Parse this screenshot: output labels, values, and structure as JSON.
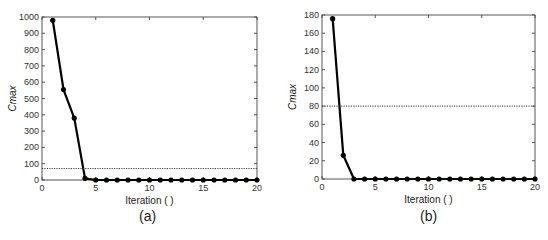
{
  "chart_data": [
    {
      "type": "line",
      "panel_label": "(a)",
      "title": "",
      "xlabel": "Iteration ( )",
      "ylabel": "Cmax",
      "xlim": [
        0,
        20
      ],
      "ylim": [
        0,
        1000
      ],
      "xticks": [
        0,
        5,
        10,
        15,
        20
      ],
      "yticks": [
        0,
        100,
        200,
        300,
        400,
        500,
        600,
        700,
        800,
        900,
        1000
      ],
      "grid": false,
      "legend": null,
      "x": [
        1,
        2,
        3,
        4,
        5,
        6,
        7,
        8,
        9,
        10,
        11,
        12,
        13,
        14,
        15,
        16,
        17,
        18,
        19,
        20
      ],
      "series": [
        {
          "name": "Cmax",
          "style": "solid-black-markers",
          "values": [
            980,
            555,
            380,
            10,
            0,
            0,
            0,
            0,
            0,
            0,
            0,
            0,
            0,
            0,
            0,
            0,
            0,
            0,
            0,
            0
          ]
        },
        {
          "name": "threshold",
          "style": "dotted",
          "constant": 70
        }
      ]
    },
    {
      "type": "line",
      "panel_label": "(b)",
      "title": "",
      "xlabel": "Iteration ( )",
      "ylabel": "Cmax",
      "xlim": [
        0,
        20
      ],
      "ylim": [
        0,
        180
      ],
      "xticks": [
        0,
        5,
        10,
        15,
        20
      ],
      "yticks": [
        0,
        20,
        40,
        60,
        80,
        100,
        120,
        140,
        160,
        180
      ],
      "grid": false,
      "legend": null,
      "x": [
        1,
        2,
        3,
        4,
        5,
        6,
        7,
        8,
        9,
        10,
        11,
        12,
        13,
        14,
        15,
        16,
        17,
        18,
        19,
        20
      ],
      "series": [
        {
          "name": "Cmax",
          "style": "solid-black-markers",
          "values": [
            176,
            26,
            0,
            0,
            0,
            0,
            0,
            0,
            0,
            0,
            0,
            0,
            0,
            0,
            0,
            0,
            0,
            0,
            0,
            0
          ]
        },
        {
          "name": "threshold",
          "style": "dotted",
          "constant": 80
        }
      ]
    }
  ],
  "panels": {
    "a": {
      "caption": "(a)",
      "xlabel": "Iteration ( )",
      "ylabel": "Cmax"
    },
    "b": {
      "caption": "(b)",
      "xlabel": "Iteration ( )",
      "ylabel": "Cmax"
    }
  },
  "colors": {
    "line": "#000000",
    "frame": "#555555",
    "threshold": "#333333"
  }
}
